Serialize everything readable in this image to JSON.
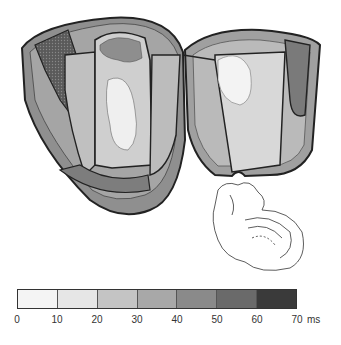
{
  "figure": {
    "panels": [
      {
        "name": "left-ventricle-section",
        "label": ""
      },
      {
        "name": "right-ventricle-section",
        "label": ""
      },
      {
        "name": "heart-orientation-inset",
        "label": ""
      }
    ]
  },
  "legend": {
    "unit": "ms",
    "ticks": [
      "0",
      "10",
      "20",
      "30",
      "40",
      "50",
      "60",
      "70"
    ],
    "unit_label": "ms",
    "segments": [
      {
        "range": "0-10",
        "color": "#f4f4f4"
      },
      {
        "range": "10-20",
        "color": "#e6e6e6"
      },
      {
        "range": "20-30",
        "color": "#c4c4c4"
      },
      {
        "range": "30-40",
        "color": "#a8a8a8"
      },
      {
        "range": "40-50",
        "color": "#8a8a8a"
      },
      {
        "range": "50-60",
        "color": "#6a6a6a"
      },
      {
        "range": "60-70",
        "color": "#3a3a3a"
      }
    ]
  },
  "colors": {
    "outline": "#222222",
    "background": "#ffffff"
  }
}
